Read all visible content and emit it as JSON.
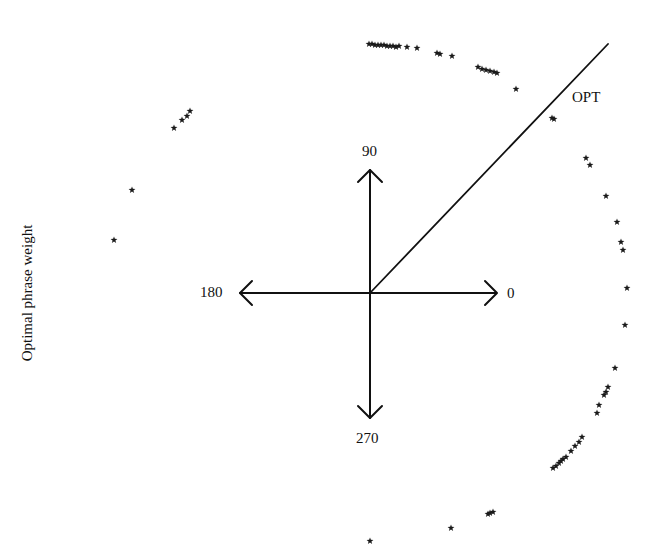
{
  "figure": {
    "ylabel": "Optimal phrase weight",
    "axis_labels": {
      "right": "0",
      "up": "90",
      "left": "180",
      "down": "270"
    },
    "line_label": "OPT",
    "colors": {
      "ink": "#111111",
      "background": "#ffffff"
    }
  },
  "chart_data": {
    "type": "scatter",
    "title": "",
    "xlabel": "",
    "ylabel": "Optimal phrase weight",
    "coordinate_system": "polar (angle in degrees)",
    "axis_directions": [
      {
        "label": "0",
        "angle_deg": 0
      },
      {
        "label": "90",
        "angle_deg": 90
      },
      {
        "label": "180",
        "angle_deg": 180
      },
      {
        "label": "270",
        "angle_deg": 270
      }
    ],
    "reference_line": {
      "label": "OPT",
      "angle_deg": 40
    },
    "marker": "star",
    "grid": false,
    "legend": null,
    "center_px": [
      370,
      293
    ],
    "points_px": [
      [
        369,
        44
      ],
      [
        372,
        44
      ],
      [
        375,
        45
      ],
      [
        378,
        45
      ],
      [
        381,
        45
      ],
      [
        384,
        45
      ],
      [
        387,
        46
      ],
      [
        390,
        46
      ],
      [
        393,
        46
      ],
      [
        396,
        47
      ],
      [
        399,
        46
      ],
      [
        407,
        47
      ],
      [
        417,
        48
      ],
      [
        437,
        53
      ],
      [
        440,
        54
      ],
      [
        452,
        56
      ],
      [
        478,
        67
      ],
      [
        482,
        69
      ],
      [
        486,
        70
      ],
      [
        490,
        71
      ],
      [
        494,
        72
      ],
      [
        497,
        73
      ],
      [
        516,
        89
      ],
      [
        552,
        118
      ],
      [
        554,
        119
      ],
      [
        586,
        158
      ],
      [
        590,
        165
      ],
      [
        606,
        196
      ],
      [
        617,
        222
      ],
      [
        621,
        242
      ],
      [
        623,
        250
      ],
      [
        627,
        288
      ],
      [
        625,
        325
      ],
      [
        615,
        368
      ],
      [
        608,
        387
      ],
      [
        606,
        392
      ],
      [
        604,
        395
      ],
      [
        599,
        405
      ],
      [
        597,
        413
      ],
      [
        582,
        437
      ],
      [
        579,
        442
      ],
      [
        575,
        446
      ],
      [
        571,
        451
      ],
      [
        566,
        457
      ],
      [
        563,
        459
      ],
      [
        561,
        461
      ],
      [
        559,
        463
      ],
      [
        556,
        466
      ],
      [
        553,
        468
      ],
      [
        493,
        512
      ],
      [
        490,
        513
      ],
      [
        488,
        514
      ],
      [
        451,
        528
      ],
      [
        370,
        541
      ],
      [
        190,
        111
      ],
      [
        187,
        116
      ],
      [
        182,
        120
      ],
      [
        174,
        128
      ],
      [
        132,
        190
      ],
      [
        114,
        240
      ]
    ]
  }
}
